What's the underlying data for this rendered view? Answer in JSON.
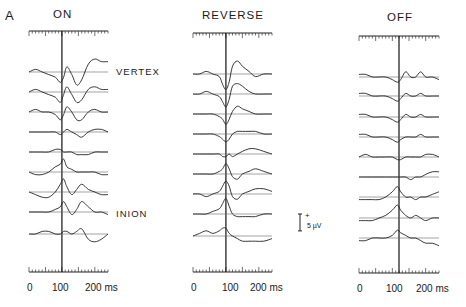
{
  "figure": {
    "panel_letter": "A",
    "site_labels": {
      "vertex": "VERTEX",
      "inion": "INION"
    },
    "scale_bar": {
      "plus": "+",
      "label": "5 µV",
      "value_uV": 5
    },
    "panels": [
      {
        "title": "ON",
        "x_ticks": [
          "0",
          "100",
          "200 ms"
        ]
      },
      {
        "title": "REVERSE",
        "x_ticks": [
          "0",
          "100",
          "200 ms"
        ]
      },
      {
        "title": "OFF",
        "x_ticks": [
          "0",
          "100",
          "200 ms"
        ]
      }
    ]
  },
  "chart_data": {
    "type": "line",
    "xlabel": "Time (ms)",
    "ylabel": "Amplitude (µV), traces stacked vertex (top) to inion (bottom)",
    "xlim": [
      0,
      240
    ],
    "x_ticks": [
      0,
      100,
      200
    ],
    "scale_bar_uV": 5,
    "grid": false,
    "legend": null,
    "annotations": [
      "VERTEX (top trace)",
      "INION (8th trace)",
      "vertical marker ~100 ms (ON, REVERSE), ~120 ms (OFF)"
    ],
    "panels": [
      {
        "name": "ON",
        "marker_ms": 100,
        "x": [
          0,
          20,
          40,
          60,
          80,
          95,
          105,
          115,
          130,
          145,
          160,
          180,
          200,
          220,
          240
        ],
        "series": [
          {
            "name": "trace 1 (vertex)",
            "values": [
              0,
              1,
              0,
              -1,
              -2,
              -4,
              -2,
              2,
              -1,
              -5,
              -3,
              3,
              5,
              4,
              4
            ]
          },
          {
            "name": "trace 2",
            "values": [
              0,
              1,
              0,
              -1,
              -2,
              -4,
              -1,
              2,
              -1,
              -4,
              -3,
              1,
              2,
              1,
              1
            ]
          },
          {
            "name": "trace 3",
            "values": [
              0,
              1,
              0,
              0,
              -1,
              -3,
              -1,
              2,
              0,
              -3,
              -3,
              0,
              1,
              0,
              0
            ]
          },
          {
            "name": "trace 4",
            "values": [
              0,
              0,
              0,
              0,
              0,
              -1,
              0,
              1,
              0,
              -1,
              -2,
              0,
              1,
              1,
              0
            ]
          },
          {
            "name": "trace 5",
            "values": [
              0,
              0,
              0,
              0,
              1,
              1,
              0,
              0,
              0,
              -1,
              -1,
              -1,
              0,
              0,
              0
            ]
          },
          {
            "name": "trace 6",
            "values": [
              0,
              -1,
              -1,
              0,
              2,
              3,
              5,
              2,
              1,
              0,
              0,
              0,
              0,
              -1,
              -1
            ]
          },
          {
            "name": "trace 7",
            "values": [
              0,
              -1,
              -2,
              -2,
              0,
              3,
              5,
              2,
              -1,
              1,
              3,
              1,
              0,
              -1,
              -1
            ]
          },
          {
            "name": "trace 8 (inion)",
            "values": [
              0,
              0,
              0,
              0,
              1,
              2,
              4,
              2,
              -1,
              1,
              4,
              2,
              0,
              0,
              -1
            ]
          },
          {
            "name": "trace 9",
            "values": [
              0,
              0,
              1,
              1,
              0,
              0,
              1,
              1,
              0,
              1,
              2,
              -2,
              -3,
              -2,
              0
            ]
          }
        ]
      },
      {
        "name": "REVERSE",
        "marker_ms": 100,
        "x": [
          0,
          20,
          40,
          60,
          80,
          90,
          100,
          110,
          120,
          135,
          150,
          170,
          190,
          215,
          240
        ],
        "series": [
          {
            "name": "trace 1 (vertex)",
            "values": [
              0,
              0,
              1,
              0,
              -1,
              -4,
              -6,
              -3,
              3,
              5,
              3,
              1,
              -1,
              0,
              0
            ]
          },
          {
            "name": "trace 2",
            "values": [
              0,
              0,
              1,
              0,
              -1,
              -3,
              -5,
              -2,
              3,
              4,
              3,
              1,
              0,
              0,
              0
            ]
          },
          {
            "name": "trace 3",
            "values": [
              0,
              0,
              0,
              0,
              -1,
              -2,
              -4,
              -2,
              1,
              3,
              2,
              1,
              0,
              0,
              0
            ]
          },
          {
            "name": "trace 4",
            "values": [
              0,
              0,
              0,
              0,
              -1,
              -2,
              -3,
              -2,
              0,
              1,
              1,
              1,
              1,
              0,
              0
            ]
          },
          {
            "name": "trace 5",
            "values": [
              0,
              0,
              0,
              0,
              0,
              -1,
              -1,
              0,
              -1,
              0,
              1,
              2,
              2,
              1,
              0
            ]
          },
          {
            "name": "trace 6",
            "values": [
              0,
              0,
              0,
              0,
              1,
              2,
              4,
              2,
              -1,
              -2,
              0,
              1,
              2,
              1,
              0
            ]
          },
          {
            "name": "trace 7",
            "values": [
              0,
              0,
              -1,
              0,
              1,
              3,
              5,
              3,
              -1,
              -2,
              0,
              1,
              2,
              2,
              1
            ]
          },
          {
            "name": "trace 8 (inion)",
            "values": [
              0,
              0,
              0,
              1,
              2,
              4,
              6,
              3,
              0,
              -1,
              -1,
              -1,
              -1,
              0,
              0
            ]
          },
          {
            "name": "trace 9",
            "values": [
              0,
              1,
              2,
              1,
              2,
              3,
              3,
              1,
              0,
              -1,
              -2,
              -2,
              -2,
              -2,
              -1
            ]
          }
        ]
      },
      {
        "name": "OFF",
        "marker_ms": 120,
        "x": [
          0,
          20,
          40,
          60,
          80,
          100,
          115,
          125,
          140,
          155,
          170,
          185,
          200,
          220,
          240
        ],
        "series": [
          {
            "name": "trace 1 (vertex)",
            "values": [
              1,
              1,
              0,
              0,
              0,
              -1,
              -2,
              -1,
              2,
              0,
              0,
              2,
              0,
              0,
              -1
            ]
          },
          {
            "name": "trace 2",
            "values": [
              1,
              1,
              0,
              0,
              0,
              -1,
              -2,
              -1,
              1,
              0,
              0,
              1,
              0,
              0,
              0
            ]
          },
          {
            "name": "trace 3",
            "values": [
              1,
              1,
              0,
              0,
              0,
              -1,
              -2,
              -1,
              1,
              0,
              0,
              1,
              0,
              0,
              0
            ]
          },
          {
            "name": "trace 4",
            "values": [
              1,
              1,
              0,
              0,
              0,
              -1,
              -2,
              -1,
              0,
              0,
              0,
              1,
              0,
              0,
              0
            ]
          },
          {
            "name": "trace 5",
            "values": [
              0,
              1,
              0,
              0,
              0,
              0,
              -1,
              -1,
              0,
              0,
              0,
              0,
              1,
              1,
              0
            ]
          },
          {
            "name": "trace 6",
            "values": [
              0,
              0,
              0,
              0,
              0,
              0,
              0,
              0,
              0,
              -1,
              0,
              0,
              1,
              2,
              2
            ]
          },
          {
            "name": "trace 7",
            "values": [
              -1,
              -1,
              -1,
              -1,
              0,
              2,
              4,
              2,
              0,
              0,
              -1,
              0,
              0,
              1,
              2
            ]
          },
          {
            "name": "trace 8 (inion)",
            "values": [
              -1,
              -1,
              -1,
              0,
              1,
              3,
              5,
              3,
              1,
              0,
              1,
              0,
              -1,
              0,
              0
            ]
          },
          {
            "name": "trace 9",
            "values": [
              -1,
              -1,
              0,
              0,
              0,
              1,
              3,
              2,
              1,
              0,
              0,
              -1,
              -2,
              -2,
              -3
            ]
          }
        ]
      }
    ]
  }
}
